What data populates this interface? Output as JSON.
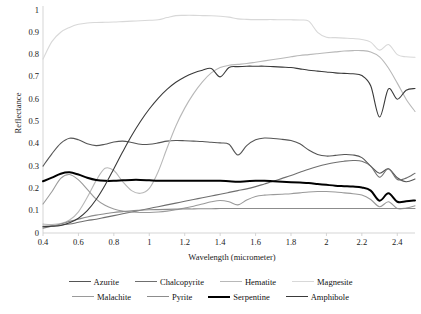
{
  "chart_data": {
    "type": "line",
    "title": "",
    "xlabel": "Wavelength (micrometer)",
    "ylabel": "Reflectance",
    "xlim": [
      0.4,
      2.5
    ],
    "ylim": [
      0,
      1
    ],
    "grid": false,
    "legend_position": "bottom",
    "xticks": [
      "0.4",
      "0.6",
      "0.8",
      "1",
      "1.2",
      "1.4",
      "1.6",
      "1.8",
      "2",
      "2.2",
      "2.4"
    ],
    "xtick_values": [
      0.4,
      0.6,
      0.8,
      1,
      1.2,
      1.4,
      1.6,
      1.8,
      2,
      2.2,
      2.4
    ],
    "yticks": [
      "0",
      "0.1",
      "0.2",
      "0.3",
      "0.4",
      "0.5",
      "0.6",
      "0.7",
      "0.8",
      "0.9",
      "1"
    ],
    "ytick_values": [
      0,
      0.1,
      0.2,
      0.3,
      0.4,
      0.5,
      0.6,
      0.7,
      0.8,
      0.9,
      1
    ],
    "x": [
      0.4,
      0.45,
      0.5,
      0.55,
      0.6,
      0.65,
      0.7,
      0.75,
      0.8,
      0.85,
      0.9,
      0.95,
      1.0,
      1.05,
      1.1,
      1.15,
      1.2,
      1.25,
      1.3,
      1.35,
      1.4,
      1.45,
      1.5,
      1.55,
      1.6,
      1.65,
      1.7,
      1.75,
      1.8,
      1.85,
      1.9,
      1.95,
      2.0,
      2.05,
      2.1,
      2.15,
      2.2,
      2.25,
      2.3,
      2.35,
      2.4,
      2.45,
      2.5
    ],
    "series": [
      {
        "name": "Azurite",
        "color": "#555555",
        "width": 1.1,
        "values": [
          0.3,
          0.355,
          0.402,
          0.425,
          0.418,
          0.4,
          0.392,
          0.398,
          0.408,
          0.412,
          0.406,
          0.398,
          0.398,
          0.404,
          0.412,
          0.415,
          0.414,
          0.412,
          0.41,
          0.407,
          0.404,
          0.398,
          0.35,
          0.392,
          0.418,
          0.426,
          0.424,
          0.42,
          0.415,
          0.4,
          0.372,
          0.352,
          0.345,
          0.348,
          0.352,
          0.35,
          0.338,
          0.3,
          0.268,
          0.288,
          0.248,
          0.23,
          0.242
        ]
      },
      {
        "name": "Chalcopyrite",
        "color": "#6f6f6f",
        "width": 1.1,
        "values": [
          0.03,
          0.032,
          0.035,
          0.04,
          0.048,
          0.056,
          0.062,
          0.07,
          0.078,
          0.086,
          0.094,
          0.102,
          0.11,
          0.118,
          0.126,
          0.134,
          0.142,
          0.15,
          0.158,
          0.166,
          0.174,
          0.182,
          0.19,
          0.198,
          0.208,
          0.22,
          0.232,
          0.245,
          0.258,
          0.272,
          0.286,
          0.298,
          0.308,
          0.316,
          0.322,
          0.325,
          0.322,
          0.3,
          0.25,
          0.288,
          0.24,
          0.246,
          0.268
        ]
      },
      {
        "name": "Hematite",
        "color": "#b8b8b8",
        "width": 1.1,
        "values": [
          0.04,
          0.038,
          0.042,
          0.058,
          0.095,
          0.16,
          0.235,
          0.29,
          0.28,
          0.23,
          0.19,
          0.178,
          0.2,
          0.275,
          0.38,
          0.48,
          0.56,
          0.625,
          0.678,
          0.718,
          0.742,
          0.752,
          0.756,
          0.76,
          0.766,
          0.772,
          0.778,
          0.784,
          0.79,
          0.796,
          0.8,
          0.804,
          0.808,
          0.812,
          0.816,
          0.818,
          0.818,
          0.812,
          0.79,
          0.74,
          0.672,
          0.6,
          0.545
        ]
      },
      {
        "name": "Magnesite",
        "color": "#d8d8d8",
        "width": 1.1,
        "values": [
          0.78,
          0.858,
          0.9,
          0.922,
          0.936,
          0.942,
          0.944,
          0.945,
          0.946,
          0.948,
          0.95,
          0.952,
          0.954,
          0.956,
          0.966,
          0.975,
          0.976,
          0.976,
          0.975,
          0.974,
          0.972,
          0.968,
          0.96,
          0.958,
          0.957,
          0.957,
          0.957,
          0.956,
          0.956,
          0.955,
          0.95,
          0.9,
          0.878,
          0.876,
          0.874,
          0.872,
          0.868,
          0.856,
          0.82,
          0.845,
          0.8,
          0.79,
          0.788
        ]
      },
      {
        "name": "Malachite",
        "color": "#9a9a9a",
        "width": 1.1,
        "values": [
          0.13,
          0.185,
          0.245,
          0.262,
          0.238,
          0.196,
          0.152,
          0.124,
          0.108,
          0.098,
          0.094,
          0.092,
          0.092,
          0.094,
          0.098,
          0.104,
          0.112,
          0.12,
          0.13,
          0.14,
          0.146,
          0.14,
          0.126,
          0.148,
          0.164,
          0.17,
          0.172,
          0.174,
          0.176,
          0.18,
          0.184,
          0.186,
          0.186,
          0.184,
          0.18,
          0.176,
          0.17,
          0.15,
          0.118,
          0.14,
          0.11,
          0.112,
          0.122
        ]
      },
      {
        "name": "Pyrite",
        "color": "#8c8c8c",
        "width": 1.1,
        "values": [
          0.022,
          0.03,
          0.04,
          0.052,
          0.062,
          0.072,
          0.08,
          0.086,
          0.092,
          0.096,
          0.1,
          0.102,
          0.104,
          0.105,
          0.106,
          0.107,
          0.108,
          0.108,
          0.109,
          0.109,
          0.11,
          0.11,
          0.11,
          0.11,
          0.11,
          0.11,
          0.11,
          0.11,
          0.11,
          0.11,
          0.11,
          0.11,
          0.11,
          0.11,
          0.11,
          0.11,
          0.11,
          0.11,
          0.11,
          0.11,
          0.11,
          0.11,
          0.11
        ]
      },
      {
        "name": "Serpentine",
        "color": "#000000",
        "width": 2.0,
        "values": [
          0.232,
          0.248,
          0.266,
          0.272,
          0.262,
          0.248,
          0.238,
          0.234,
          0.234,
          0.236,
          0.238,
          0.238,
          0.236,
          0.234,
          0.234,
          0.234,
          0.234,
          0.234,
          0.234,
          0.234,
          0.234,
          0.232,
          0.23,
          0.232,
          0.234,
          0.234,
          0.232,
          0.23,
          0.228,
          0.226,
          0.224,
          0.22,
          0.216,
          0.212,
          0.21,
          0.208,
          0.204,
          0.19,
          0.145,
          0.178,
          0.14,
          0.142,
          0.146
        ]
      },
      {
        "name": "Amphibole",
        "color": "#3a3a3a",
        "width": 1.1,
        "values": [
          0.028,
          0.03,
          0.034,
          0.046,
          0.066,
          0.1,
          0.15,
          0.214,
          0.288,
          0.364,
          0.436,
          0.5,
          0.556,
          0.604,
          0.644,
          0.676,
          0.7,
          0.718,
          0.73,
          0.738,
          0.7,
          0.742,
          0.746,
          0.748,
          0.748,
          0.748,
          0.746,
          0.744,
          0.742,
          0.736,
          0.73,
          0.726,
          0.722,
          0.718,
          0.716,
          0.714,
          0.706,
          0.66,
          0.52,
          0.646,
          0.6,
          0.64,
          0.648
        ]
      }
    ],
    "annotations": []
  },
  "legend": {
    "rows": [
      [
        {
          "label": "Azurite",
          "color": "#555555",
          "width": 1.2
        },
        {
          "label": "Chalcopyrite",
          "color": "#6f6f6f",
          "width": 1.2
        },
        {
          "label": "Hematite",
          "color": "#b8b8b8",
          "width": 1.2
        },
        {
          "label": "Magnesite",
          "color": "#d8d8d8",
          "width": 1.2
        }
      ],
      [
        {
          "label": "Malachite",
          "color": "#9a9a9a",
          "width": 1.2
        },
        {
          "label": "Pyrite",
          "color": "#8c8c8c",
          "width": 1.2
        },
        {
          "label": "Serpentine",
          "color": "#000000",
          "width": 2.2
        },
        {
          "label": "Amphibole",
          "color": "#3a3a3a",
          "width": 1.2
        }
      ]
    ]
  },
  "axes": {
    "axis_color": "#d0d0d0",
    "tick_color": "#1a1a1a"
  }
}
